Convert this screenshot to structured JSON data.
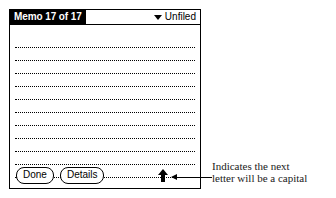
{
  "device": {
    "title_bar": {
      "memo_title": "Memo 17 of 17",
      "category_label": "Unfiled",
      "chevron_icon": "chevron-down-icon"
    },
    "body": {
      "line_count": 11,
      "content": ""
    },
    "toolbar": {
      "done_label": "Done",
      "details_label": "Details",
      "shift_indicator_icon": "arrow-up-icon"
    }
  },
  "annotation": {
    "arrow_icon": "arrow-left-icon",
    "line1": "Indicates the next",
    "line2": "letter will be a capital"
  },
  "colors": {
    "ink": "#000000",
    "paper": "#ffffff",
    "annotation_text": "#1a1a1a"
  }
}
